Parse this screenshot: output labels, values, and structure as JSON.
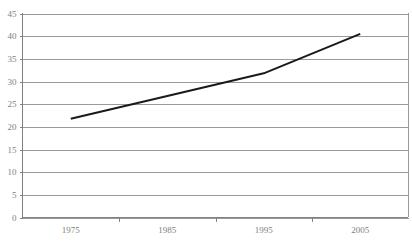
{
  "chart_data": {
    "type": "line",
    "title": "",
    "subtitle": "",
    "xlabel": "",
    "ylabel": "",
    "grid": true,
    "legend": false,
    "legend_position": "none",
    "xlim": [
      1970,
      2010
    ],
    "ylim": [
      0,
      45
    ],
    "y_ticks": [
      0,
      5,
      10,
      15,
      20,
      25,
      30,
      35,
      40,
      45
    ],
    "y_tick_labels": [
      "0",
      "5",
      "10",
      "15",
      "20",
      "25",
      "30",
      "35",
      "40",
      "45"
    ],
    "x_categories": [
      "1975",
      "1985",
      "1995",
      "2005"
    ],
    "x_tick_labels": [
      "1975",
      "1985",
      "1995",
      "2005"
    ],
    "series": [
      {
        "name": "series-1",
        "color": "#1a1a1a",
        "x": [
          "1975",
          "1985",
          "1995",
          "2005"
        ],
        "values": [
          21.8,
          26.8,
          31.8,
          40.5
        ]
      }
    ]
  },
  "axes": {
    "y_axis_name": "value-axis",
    "x_axis_name": "year-axis"
  },
  "colors": {
    "line": "#1a1a1a",
    "grid": "#9a9a9a",
    "axis": "#808080",
    "label": "#808080",
    "background": "#ffffff"
  }
}
